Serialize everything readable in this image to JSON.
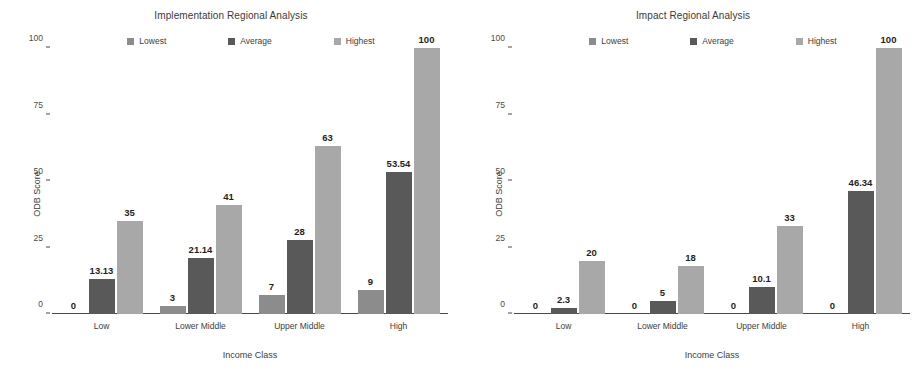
{
  "figure": {
    "panels": [
      "left",
      "right"
    ],
    "background": "#ffffff"
  },
  "series_colors": {
    "lowest": "#8c8c8c",
    "average": "#595959",
    "highest": "#a8a8a8"
  },
  "legend": {
    "lowest": "Lowest",
    "average": "Average",
    "highest": "Highest"
  },
  "axes": {
    "ylabel": "ODB Score",
    "xlabel": "Income Class",
    "yticks": [
      "0",
      "25",
      "50",
      "75",
      "100"
    ],
    "categories": [
      "Low",
      "Lower Middle",
      "Upper Middle",
      "High"
    ]
  },
  "chart_data": [
    {
      "type": "bar",
      "title": "Implementation Regional Analysis",
      "xlabel": "Income Class",
      "ylabel": "ODB Score",
      "ylim": [
        0,
        100
      ],
      "yticks": [
        0,
        25,
        50,
        75,
        100
      ],
      "grid": false,
      "legend_position": "top-center",
      "categories": [
        "Low",
        "Lower Middle",
        "Upper Middle",
        "High"
      ],
      "series": [
        {
          "name": "Lowest",
          "color": "#8c8c8c",
          "values": [
            0,
            3,
            7,
            9
          ],
          "labels": [
            "0",
            "3",
            "7",
            "9"
          ]
        },
        {
          "name": "Average",
          "color": "#595959",
          "values": [
            13.13,
            21.14,
            28,
            53.54
          ],
          "labels": [
            "13.13",
            "21.14",
            "28",
            "53.54"
          ]
        },
        {
          "name": "Highest",
          "color": "#a8a8a8",
          "values": [
            35,
            41,
            63,
            100
          ],
          "labels": [
            "35",
            "41",
            "63",
            "100"
          ]
        }
      ]
    },
    {
      "type": "bar",
      "title": "Impact Regional Analysis",
      "xlabel": "Income Class",
      "ylabel": "ODB Score",
      "ylim": [
        0,
        100
      ],
      "yticks": [
        0,
        25,
        50,
        75,
        100
      ],
      "grid": false,
      "legend_position": "top-center",
      "categories": [
        "Low",
        "Lower Middle",
        "Upper Middle",
        "High"
      ],
      "series": [
        {
          "name": "Lowest",
          "color": "#8c8c8c",
          "values": [
            0,
            0,
            0,
            0
          ],
          "labels": [
            "0",
            "0",
            "0",
            "0"
          ]
        },
        {
          "name": "Average",
          "color": "#595959",
          "values": [
            2.3,
            5,
            10.1,
            46.34
          ],
          "labels": [
            "2.3",
            "5",
            "10.1",
            "46.34"
          ]
        },
        {
          "name": "Highest",
          "color": "#a8a8a8",
          "values": [
            20,
            18,
            33,
            100
          ],
          "labels": [
            "20",
            "18",
            "33",
            "100"
          ]
        }
      ]
    }
  ]
}
